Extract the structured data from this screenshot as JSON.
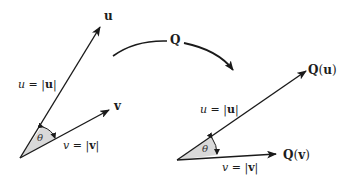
{
  "diagram": {
    "colors": {
      "stroke": "#1a1a1a",
      "wedge_fill": "#d9d9d9",
      "background": "#ffffff"
    },
    "left": {
      "vector_u_label": "u",
      "vector_v_label": "v",
      "length_u_label": "u = |u|",
      "length_u": {
        "var": "u",
        "eq": " = ",
        "abs": "u"
      },
      "length_v": {
        "var": "v",
        "eq": " = ",
        "abs": "v"
      },
      "angle_label": "θ"
    },
    "transform": {
      "label": "Q"
    },
    "right": {
      "vector_qu_label": {
        "fn": "Q",
        "arg": "u"
      },
      "vector_qv_label": {
        "fn": "Q",
        "arg": "v"
      },
      "length_u": {
        "var": "u",
        "eq": " = ",
        "abs": "u"
      },
      "length_v": {
        "var": "v",
        "eq": " = ",
        "abs": "v"
      },
      "angle_label": "θ"
    }
  }
}
